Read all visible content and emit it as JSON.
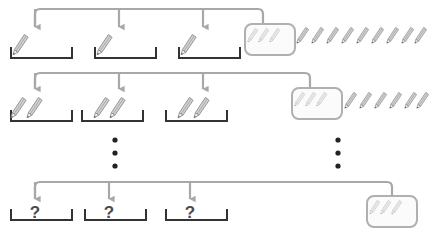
{
  "figure": {
    "title": "",
    "background_color": "#ffffff",
    "width": 430,
    "height": 234,
    "colors": {
      "connector": "#a8a8a8",
      "bracket": "#333333",
      "pencil_body_dark": "#8c8c8c",
      "pencil_body_light": "#c9c9c9",
      "box_border": "#b0b0b0",
      "box_fill": "#fbfbfb",
      "dot": "#222222",
      "question_text": "#4a4a4a"
    }
  },
  "levels": [
    {
      "id": "level-1",
      "label": "Level 1",
      "leaf_count": 3,
      "pencils_per_leaf": 1,
      "leaves": [
        {
          "label": "leaf-1-1",
          "pencils": 1,
          "text": ""
        },
        {
          "label": "leaf-1-2",
          "pencils": 1,
          "text": ""
        },
        {
          "label": "leaf-1-3",
          "pencils": 1,
          "text": ""
        }
      ],
      "pool_box": {
        "label": "pool-box-1",
        "pencils": 3
      },
      "remaining_pencils": 9
    },
    {
      "id": "level-2",
      "label": "Level 2",
      "leaf_count": 3,
      "pencils_per_leaf": 2,
      "leaves": [
        {
          "label": "leaf-2-1",
          "pencils": 2,
          "text": ""
        },
        {
          "label": "leaf-2-2",
          "pencils": 2,
          "text": ""
        },
        {
          "label": "leaf-2-3",
          "pencils": 2,
          "text": ""
        }
      ],
      "pool_box": {
        "label": "pool-box-2",
        "pencils": 3
      },
      "remaining_pencils": 6
    },
    {
      "id": "level-n",
      "label": "Level N",
      "leaf_count": 3,
      "pencils_per_leaf": 0,
      "leaves": [
        {
          "label": "leaf-n-1",
          "pencils": 0,
          "text": "?"
        },
        {
          "label": "leaf-n-2",
          "pencils": 0,
          "text": "?"
        },
        {
          "label": "leaf-n-3",
          "pencils": 0,
          "text": "?"
        }
      ],
      "pool_box": {
        "label": "pool-box-n",
        "pencils": 3
      },
      "remaining_pencils": 0
    }
  ],
  "ellipses": [
    {
      "label": "ellipsis-left",
      "dots": 3
    },
    {
      "label": "ellipsis-right",
      "dots": 3
    }
  ],
  "icons": {
    "pencil": "pencil-icon",
    "arrow": "arrow-down-icon",
    "bracket": "bracket-container-icon",
    "question": "question-mark-icon",
    "dot": "dot-icon"
  }
}
